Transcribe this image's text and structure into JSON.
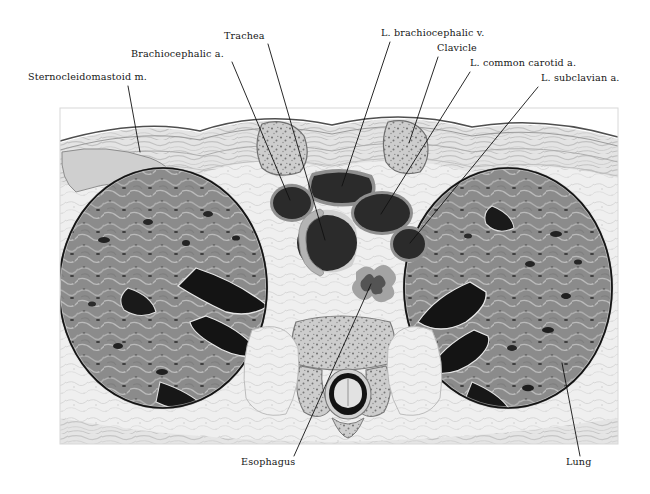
{
  "figure": {
    "kind": "axial-cross-section-illustration",
    "region": "superior mediastinum / thoracic inlet",
    "background_color": "#ffffff",
    "panel": {
      "x": 60,
      "y": 108,
      "width": 558,
      "height": 336,
      "border_color": "#d8d8d8"
    },
    "palette": {
      "lung_parenchyma": "#8b8b8b",
      "lung_septa": "#d6d6d6",
      "vessel_lumen": "#2b2b2b",
      "vessel_wall": "#8e8e8e",
      "soft_tissue": "#ececec",
      "fat_plane": "#f4f4f4",
      "bone_cortex": "#9a9a9a",
      "bone_marrow": "#c9c9c9",
      "skin_line": "#5a5a5a",
      "muscle": "#c2c2c2",
      "outline": "#1a1a1a",
      "leader_line": "#111111",
      "label_text": "#161616"
    }
  },
  "labels": [
    {
      "id": "sternocleidomastoid",
      "text": "Sternocleidomastoid m.",
      "anchor": "start",
      "text_x": 28,
      "text_y": 80,
      "leader": [
        [
          128,
          86
        ],
        [
          140,
          152
        ]
      ]
    },
    {
      "id": "brachiocephalic-artery",
      "text": "Brachiocephalic a.",
      "anchor": "start",
      "text_x": 131,
      "text_y": 57,
      "leader": [
        [
          232,
          62
        ],
        [
          290,
          200
        ]
      ]
    },
    {
      "id": "trachea",
      "text": "Trachea",
      "anchor": "start",
      "text_x": 224,
      "text_y": 39,
      "leader": [
        [
          268,
          44
        ],
        [
          325,
          240
        ]
      ]
    },
    {
      "id": "left-brachiocephalic-vein",
      "text": "L. brachiocephalic v.",
      "anchor": "start",
      "text_x": 381,
      "text_y": 36,
      "leader": [
        [
          390,
          42
        ],
        [
          342,
          186
        ]
      ]
    },
    {
      "id": "clavicle",
      "text": "Clavicle",
      "anchor": "start",
      "text_x": 437,
      "text_y": 51,
      "leader": [
        [
          438,
          57
        ],
        [
          409,
          143
        ]
      ]
    },
    {
      "id": "left-common-carotid-artery",
      "text": "L. common carotid a.",
      "anchor": "start",
      "text_x": 470,
      "text_y": 66,
      "leader": [
        [
          470,
          72
        ],
        [
          381,
          214
        ]
      ]
    },
    {
      "id": "left-subclavian-artery",
      "text": "L. subclavian a.",
      "anchor": "start",
      "text_x": 541,
      "text_y": 81,
      "leader": [
        [
          538,
          87
        ],
        [
          410,
          243
        ]
      ]
    },
    {
      "id": "esophagus",
      "text": "Esophagus",
      "anchor": "start",
      "text_x": 241,
      "text_y": 465,
      "leader": [
        [
          294,
          456
        ],
        [
          371,
          284
        ]
      ]
    },
    {
      "id": "lung",
      "text": "Lung",
      "anchor": "start",
      "text_x": 566,
      "text_y": 465,
      "leader": [
        [
          580,
          456
        ],
        [
          562,
          363
        ]
      ]
    }
  ],
  "structures": [
    {
      "id": "right-lung",
      "name": "Lung (right side of image)",
      "cx": 163,
      "cy": 288,
      "rx": 104,
      "ry": 120
    },
    {
      "id": "left-lung",
      "name": "Lung (left side of image)",
      "cx": 508,
      "cy": 288,
      "rx": 104,
      "ry": 120
    },
    {
      "id": "trachea-lumen",
      "name": "Trachea",
      "cx": 327,
      "cy": 243,
      "rx": 30,
      "ry": 28
    },
    {
      "id": "brachiocephalic-a-lumen",
      "name": "Brachiocephalic a.",
      "cx": 292,
      "cy": 203,
      "rx": 21,
      "ry": 18
    },
    {
      "id": "l-brachiocephalic-v-lumen",
      "name": "L. brachiocephalic v.",
      "cx": 342,
      "cy": 187,
      "rx": 33,
      "ry": 19
    },
    {
      "id": "l-common-carotid-lumen",
      "name": "L. common carotid a.",
      "cx": 382,
      "cy": 213,
      "rx": 29,
      "ry": 21
    },
    {
      "id": "l-subclavian-lumen",
      "name": "L. subclavian a.",
      "cx": 409,
      "cy": 244,
      "rx": 18,
      "ry": 17
    },
    {
      "id": "esophagus-lumen",
      "name": "Esophagus",
      "cx": 372,
      "cy": 283,
      "rx": 19,
      "ry": 17
    },
    {
      "id": "clavicle-right",
      "name": "Clavicle (right)",
      "cx": 283,
      "cy": 148,
      "rx": 27,
      "ry": 28
    },
    {
      "id": "clavicle-left",
      "name": "Clavicle (left)",
      "cx": 406,
      "cy": 146,
      "rx": 24,
      "ry": 27
    },
    {
      "id": "vertebral-body",
      "name": "Thoracic vertebral body",
      "cx": 343,
      "cy": 348,
      "rx": 42,
      "ry": 26
    },
    {
      "id": "spinal-canal",
      "name": "Spinal canal / cord",
      "cx": 348,
      "cy": 394,
      "rx": 21,
      "ry": 23
    }
  ]
}
